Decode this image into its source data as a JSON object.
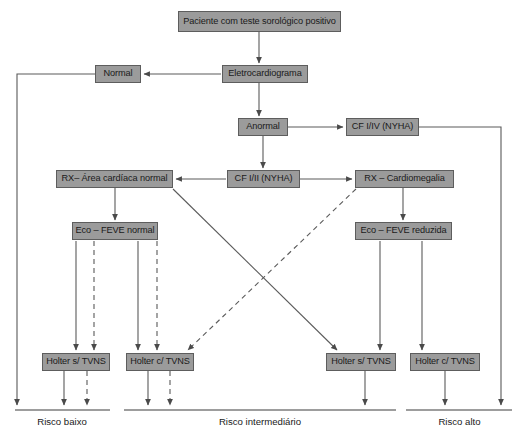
{
  "diagram": {
    "style": {
      "node_fill": "#9b9b9b",
      "node_border": "#5d5d5d",
      "edge_color": "#555555",
      "text_color": "#1a1a1a",
      "background": "#ffffff"
    },
    "nodes": [
      {
        "id": "paciente",
        "label": "Paciente com teste sorológico positivo",
        "x": 178,
        "y": 11,
        "w": 163,
        "h": 21
      },
      {
        "id": "normal",
        "label": "Normal",
        "x": 95,
        "y": 65,
        "w": 46,
        "h": 18
      },
      {
        "id": "ecg",
        "label": "Eletrocardiograma",
        "x": 222,
        "y": 65,
        "w": 86,
        "h": 18
      },
      {
        "id": "anormal",
        "label": "Anormal",
        "x": 238,
        "y": 118,
        "w": 50,
        "h": 18
      },
      {
        "id": "cf34",
        "label": "CF I/IV (NYHA)",
        "x": 346,
        "y": 118,
        "w": 73,
        "h": 18
      },
      {
        "id": "rx_normal",
        "label": "RX– Área cardíaca normal",
        "x": 56,
        "y": 170,
        "w": 117,
        "h": 18
      },
      {
        "id": "cf12",
        "label": "CF I/II (NYHA)",
        "x": 227,
        "y": 170,
        "w": 73,
        "h": 18
      },
      {
        "id": "rx_cardio",
        "label": "RX – Cardiomegalia",
        "x": 355,
        "y": 170,
        "w": 99,
        "h": 18
      },
      {
        "id": "eco_normal",
        "label": "Eco – FEVE normal",
        "x": 72,
        "y": 222,
        "w": 86,
        "h": 18
      },
      {
        "id": "eco_reduzida",
        "label": "Eco – FEVE reduzida",
        "x": 355,
        "y": 222,
        "w": 97,
        "h": 18
      },
      {
        "id": "holter_s1",
        "label": "Holter s/ TVNS",
        "x": 42,
        "y": 353,
        "w": 68,
        "h": 18
      },
      {
        "id": "holter_c1",
        "label": "Holter c/ TVNS",
        "x": 126,
        "y": 353,
        "w": 68,
        "h": 18
      },
      {
        "id": "holter_s2",
        "label": "Holter s/ TVNS",
        "x": 326,
        "y": 353,
        "w": 70,
        "h": 18
      },
      {
        "id": "holter_c2",
        "label": "Holter c/ TVNS",
        "x": 410,
        "y": 353,
        "w": 70,
        "h": 18
      }
    ],
    "risk_groups": [
      {
        "id": "risco_baixo",
        "label": "Risco baixo",
        "line_x1": 15,
        "line_x2": 110,
        "line_y": 410,
        "label_cx": 62,
        "label_y": 416
      },
      {
        "id": "risco_intermediario",
        "label": "Risco intermediário",
        "line_x1": 124,
        "line_x2": 396,
        "line_y": 410,
        "label_cx": 260,
        "label_y": 416
      },
      {
        "id": "risco_alto",
        "label": "Risco alto",
        "line_x1": 406,
        "line_x2": 512,
        "line_y": 410,
        "label_cx": 459,
        "label_y": 416
      }
    ],
    "edges": [
      {
        "id": "paciente-to-ecg",
        "type": "solid",
        "arrow": true
      },
      {
        "id": "ecg-to-normal",
        "type": "solid",
        "arrow": true
      },
      {
        "id": "ecg-to-anormal",
        "type": "solid",
        "arrow": true
      },
      {
        "id": "normal-to-risco-baixo",
        "type": "solid",
        "arrow": true
      },
      {
        "id": "anormal-to-cf34",
        "type": "solid",
        "arrow": true
      },
      {
        "id": "anormal-to-cf12",
        "type": "solid",
        "arrow": true
      },
      {
        "id": "cf34-to-risco-alto",
        "type": "solid",
        "arrow": true
      },
      {
        "id": "cf12-to-rx-normal",
        "type": "solid",
        "arrow": true
      },
      {
        "id": "cf12-to-rx-cardiomegalia",
        "type": "solid",
        "arrow": true
      },
      {
        "id": "rx-normal-to-eco-normal",
        "type": "solid",
        "arrow": true
      },
      {
        "id": "rx-cardiomegalia-to-eco-reduzida",
        "type": "solid",
        "arrow": true
      },
      {
        "id": "rx-normal-to-holter-s-intermediate",
        "type": "solid",
        "arrow": true
      },
      {
        "id": "rx-cardiomegalia-to-holter-c-baixo",
        "type": "dashed",
        "arrow": true
      },
      {
        "id": "eco-normal-to-holter-s1-solid",
        "type": "solid",
        "arrow": true
      },
      {
        "id": "eco-normal-to-holter-s1-dashed",
        "type": "dashed",
        "arrow": true
      },
      {
        "id": "eco-normal-to-holter-c1-solid",
        "type": "solid",
        "arrow": true
      },
      {
        "id": "eco-normal-to-holter-c1-dashed",
        "type": "dashed",
        "arrow": true
      },
      {
        "id": "eco-reduzida-to-holter-s2",
        "type": "solid",
        "arrow": true
      },
      {
        "id": "eco-reduzida-to-holter-c2",
        "type": "solid",
        "arrow": true
      },
      {
        "id": "holter-s1-to-risco-baixo-solid",
        "type": "solid",
        "arrow": true
      },
      {
        "id": "holter-s1-to-risco-baixo-dashed",
        "type": "dashed",
        "arrow": true
      },
      {
        "id": "holter-c1-to-risco-solid",
        "type": "solid",
        "arrow": true
      },
      {
        "id": "holter-c1-to-risco-dashed",
        "type": "dashed",
        "arrow": true
      },
      {
        "id": "holter-s2-to-risco-intermediario",
        "type": "solid",
        "arrow": true
      },
      {
        "id": "holter-c2-to-risco-alto",
        "type": "solid",
        "arrow": true
      }
    ]
  }
}
